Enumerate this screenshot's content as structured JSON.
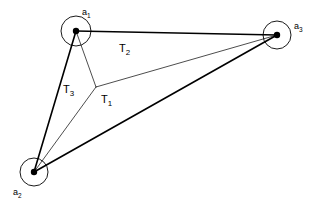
{
  "figure": {
    "type": "geometric-diagram",
    "background_color": "#ffffff",
    "stroke_color": "#000000",
    "width": 321,
    "height": 205
  },
  "nodes": [
    {
      "id": "a1",
      "label_main": "a",
      "label_sub": "1",
      "center_x": 76,
      "center_y": 31,
      "circle_radius": 15,
      "dot_radius": 3.2,
      "label_x": 82,
      "label_y": 8
    },
    {
      "id": "a2",
      "label_main": "a",
      "label_sub": "2",
      "center_x": 34,
      "center_y": 172,
      "circle_radius": 14,
      "dot_radius": 3.2,
      "label_x": 13,
      "label_y": 188
    },
    {
      "id": "a3",
      "label_main": "a",
      "label_sub": "3",
      "center_x": 277,
      "center_y": 35,
      "circle_radius": 14,
      "dot_radius": 3.2,
      "label_x": 294,
      "label_y": 22
    }
  ],
  "junction": {
    "id": "center-junction",
    "x": 96,
    "y": 87
  },
  "thick_edges": [
    {
      "id": "edge-a1-a3",
      "x1": 76,
      "y1": 31,
      "x2": 277,
      "y2": 35,
      "width": 1.6
    },
    {
      "id": "edge-a1-a2",
      "x1": 76,
      "y1": 31,
      "x2": 34,
      "y2": 172,
      "width": 1.6
    },
    {
      "id": "edge-a2-a3",
      "x1": 34,
      "y1": 172,
      "x2": 277,
      "y2": 35,
      "width": 1.6
    }
  ],
  "thin_edges": [
    {
      "id": "spoke-junction-a1",
      "x1": 96,
      "y1": 87,
      "x2": 76,
      "y2": 31,
      "width": 0.7
    },
    {
      "id": "spoke-junction-a2",
      "x1": 96,
      "y1": 87,
      "x2": 34,
      "y2": 172,
      "width": 0.7
    },
    {
      "id": "spoke-junction-a3",
      "x1": 96,
      "y1": 87,
      "x2": 277,
      "y2": 35,
      "width": 0.7
    }
  ],
  "region_labels": [
    {
      "id": "T1",
      "label_main": "T",
      "label_sub": "1",
      "x": 101,
      "y": 94
    },
    {
      "id": "T2",
      "label_main": "T",
      "label_sub": "2",
      "x": 119,
      "y": 43
    },
    {
      "id": "T3",
      "label_main": "T",
      "label_sub": "3",
      "x": 63,
      "y": 84
    }
  ]
}
